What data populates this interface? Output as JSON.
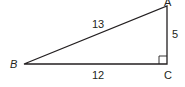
{
  "diagram": {
    "type": "right-triangle",
    "vertices": {
      "A": {
        "label": "A"
      },
      "B": {
        "label": "B"
      },
      "C": {
        "label": "C"
      }
    },
    "sides": {
      "AB": {
        "label": "13"
      },
      "BC": {
        "label": "12"
      },
      "AC": {
        "label": "5"
      }
    },
    "right_angle_at": "C",
    "stroke_color": "#231f20"
  }
}
